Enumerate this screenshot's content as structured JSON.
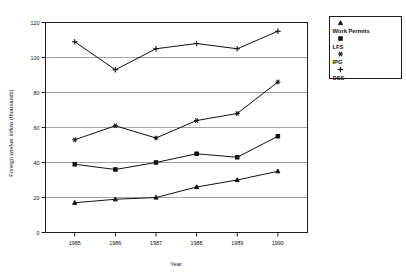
{
  "chart_data": {
    "type": "line",
    "title": "",
    "xlabel": "Year",
    "ylabel": "Foreign worker inflow (thousands)",
    "categories": [
      "1985",
      "1986",
      "1987",
      "1988",
      "1989",
      "1990"
    ],
    "x": [
      1985,
      1986,
      1987,
      1988,
      1989,
      1990
    ],
    "xlim": [
      1984.6,
      1990.6
    ],
    "ylim": [
      0,
      120
    ],
    "yticks": [
      0,
      20,
      40,
      60,
      80,
      100,
      120
    ],
    "ytick_labels": [
      "0",
      "20",
      "40",
      "60",
      "80",
      "100",
      "120"
    ],
    "xtick_labels": [
      "1985",
      "1986",
      "1987",
      "1988",
      "1989",
      "1990"
    ],
    "grid": true,
    "grid_axis": "y",
    "legend_position": "top-right",
    "series": [
      {
        "name": "Work Permits",
        "marker": "triangle-up",
        "values": [
          17,
          19,
          20,
          26,
          30,
          35
        ]
      },
      {
        "name": "LFS",
        "marker": "square",
        "values": [
          39,
          36,
          40,
          45,
          43,
          55
        ]
      },
      {
        "name": "IPG",
        "marker": "asterisk",
        "values": [
          53,
          61,
          54,
          64,
          68,
          86
        ]
      },
      {
        "name": "DSS",
        "marker": "plus",
        "values": [
          109,
          93,
          105,
          108,
          105,
          115
        ]
      }
    ]
  },
  "legend": {
    "entries": [
      {
        "label": "Work Permits",
        "marker": "triangle-up"
      },
      {
        "label": "LFS",
        "marker": "square"
      },
      {
        "label": "IPG",
        "marker": "asterisk"
      },
      {
        "label": "DSS",
        "marker": "plus"
      }
    ]
  },
  "axes": {
    "y_title": "Foreign worker inflow (thousands)",
    "x_title": "Year"
  },
  "colors": {
    "ink": "#111111",
    "grid": "#8c8c8c",
    "background": "#ffffff"
  }
}
